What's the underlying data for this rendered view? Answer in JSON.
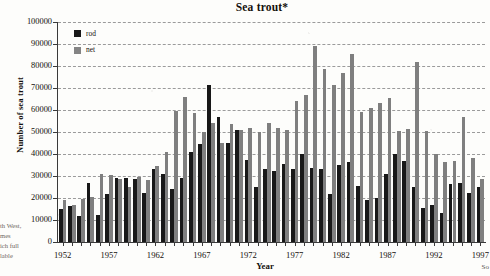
{
  "chart_data": {
    "type": "bar",
    "title": "Sea trout*",
    "xlabel": "Year",
    "ylabel": "Number of sea trout",
    "ylim": [
      0,
      100000
    ],
    "ytick_step": 10000,
    "yticks": [
      "0",
      "10000",
      "20000",
      "30000",
      "40000",
      "50000",
      "60000",
      "70000",
      "80000",
      "90000",
      "100000"
    ],
    "grid": true,
    "legend_position": "top-left",
    "xtick_labels": [
      "1952",
      "1957",
      "1962",
      "1967",
      "1972",
      "1977",
      "1982",
      "1987",
      "1992",
      "1997"
    ],
    "xtick_step": 5,
    "categories": [
      1952,
      1953,
      1954,
      1955,
      1956,
      1957,
      1958,
      1959,
      1960,
      1961,
      1962,
      1963,
      1964,
      1965,
      1966,
      1967,
      1968,
      1969,
      1970,
      1971,
      1972,
      1973,
      1974,
      1975,
      1976,
      1977,
      1978,
      1979,
      1980,
      1981,
      1982,
      1983,
      1984,
      1985,
      1986,
      1987,
      1988,
      1989,
      1990,
      1991,
      1992,
      1993,
      1994,
      1995,
      1996,
      1997
    ],
    "series": [
      {
        "name": "rod",
        "color": "#181818",
        "values": [
          15000,
          16500,
          12000,
          27000,
          12500,
          22000,
          29000,
          29000,
          28500,
          22500,
          33000,
          31000,
          24000,
          29000,
          41000,
          44500,
          71500,
          57000,
          45000,
          51000,
          37500,
          25000,
          33000,
          32500,
          35500,
          33000,
          40000,
          33500,
          33000,
          22000,
          35000,
          36500,
          25500,
          19000,
          20000,
          31000,
          40000,
          37000,
          25000,
          15500,
          17000,
          13000,
          26500,
          27000,
          22500,
          25000
        ]
      },
      {
        "name": "net",
        "color": "#7f7f7f",
        "values": [
          19000,
          17000,
          19500,
          20500,
          31000,
          30500,
          28500,
          25000,
          29500,
          28000,
          34500,
          41000,
          59500,
          66000,
          58500,
          50000,
          54000,
          45000,
          53500,
          51000,
          52000,
          50000,
          54000,
          52000,
          51000,
          64000,
          67000,
          89000,
          78500,
          71500,
          77000,
          85500,
          59000,
          61000,
          63000,
          65500,
          50500,
          51500,
          82000,
          50500,
          40000,
          36500,
          37000,
          57000,
          38000,
          28500
        ]
      }
    ]
  },
  "bleed_text": {
    "line0": "th West,",
    "line1": "mes",
    "line2": "ich full",
    "line3": "lable",
    "corner": "So"
  },
  "legend": {
    "rod_label": "rod",
    "net_label": "net"
  }
}
